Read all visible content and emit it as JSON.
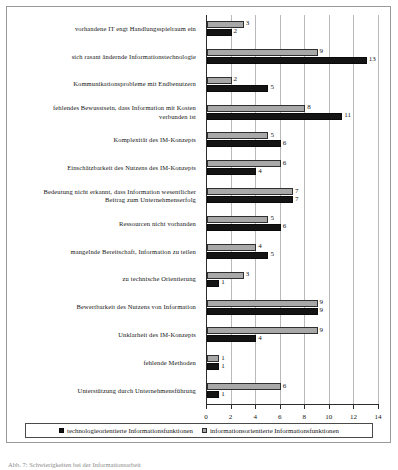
{
  "chart_data": {
    "type": "bar",
    "orientation": "horizontal",
    "title": "",
    "xlabel": "",
    "ylabel": "",
    "xlim": [
      0,
      14
    ],
    "xticks": [
      0,
      2,
      4,
      6,
      8,
      10,
      12,
      14
    ],
    "xtick_labels": [
      "0",
      "2",
      "4",
      "6",
      "8",
      "10",
      "12",
      "14"
    ],
    "grid": true,
    "legend_position": "bottom",
    "categories": [
      "vorhandene IT engt Handlungsspielraum ein",
      "sich rasant ändernde Informationstechnologie",
      "Kommunikationsprobleme mit Endbenutzern",
      "fehlendes Bewusstsein, dass Information mit Kosten verbunden ist",
      "Komplexität des IM-Konzepts",
      "Einschätzbarkeit des Nutzens des IM-Konzepts",
      "Bedeutung nicht erkannt, dass Information wesentlicher Beitrag zum Unternehmenserfolg",
      "Ressourcen nicht vorhanden",
      "mangelnde Bereitschaft, Information zu teilen",
      "zu technische Orientierung",
      "Bewertbarkeit des Nutzens von Information",
      "Unklarheit des IM-Konzepts",
      "fehlende Methoden",
      "Unterstützung durch Unternehmensführung"
    ],
    "category_lines": [
      [
        "vorhandene IT engt Handlungsspielraum ein"
      ],
      [
        "sich rasant ändernde Informationstechnologie"
      ],
      [
        "Kommunikationsprobleme mit Endbenutzern"
      ],
      [
        "fehlendes Bewusstsein, dass Information mit Kosten",
        "verbunden ist"
      ],
      [
        "Komplexität des IM-Konzepts"
      ],
      [
        "Einschätzbarkeit des Nutzens des IM-Konzepts"
      ],
      [
        "Bedeutung nicht erkannt, dass Information wesentlicher",
        "Beitrag zum Unternehmenserfolg"
      ],
      [
        "Ressourcen nicht vorhanden"
      ],
      [
        "mangelnde Bereitschaft, Information zu teilen"
      ],
      [
        "zu technische Orientierung"
      ],
      [
        "Bewertbarkeit des Nutzens von Information"
      ],
      [
        "Unklarheit des IM-Konzepts"
      ],
      [
        "fehlende Methoden"
      ],
      [
        "Unterstützung durch Unternehmensführung"
      ]
    ],
    "series": [
      {
        "name": "informationsorientierte Informationsfunktionen",
        "color": "#a8a8a8",
        "values": [
          3,
          9,
          2,
          8,
          5,
          6,
          7,
          5,
          4,
          3,
          9,
          9,
          1,
          6
        ]
      },
      {
        "name": "technologieorientierte Informationsfunktionen",
        "color": "#141414",
        "values": [
          2,
          13,
          5,
          11,
          6,
          4,
          7,
          6,
          5,
          1,
          9,
          4,
          1,
          1
        ]
      }
    ]
  },
  "legend": {
    "entries": [
      {
        "label": "technologieorientierte Informationsfunktionen",
        "swatch": "tech"
      },
      {
        "label": "informationsorientierte Informationsfunktionen",
        "swatch": "info"
      }
    ]
  },
  "caption": {
    "text": "Abb. 7: Schwierigkeiten bei der Informationsarbeit"
  }
}
